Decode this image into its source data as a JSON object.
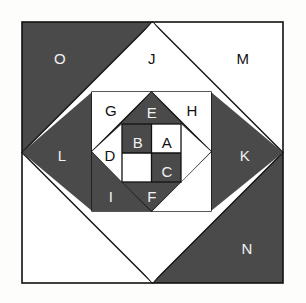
{
  "figure": {
    "canvas": {
      "width": 306,
      "height": 303
    },
    "colors": {
      "dark": "#4a4a4a",
      "light": "#ffffff",
      "stroke": "#111111",
      "background": "#fdfdfb",
      "label_on_dark": "#f2f2f2",
      "label_on_light": "#121212"
    },
    "regions": [
      {
        "id": "A",
        "label": "A",
        "fill": "light",
        "x": 167,
        "y": 142,
        "shape": "square-cell"
      },
      {
        "id": "B",
        "label": "B",
        "fill": "dark",
        "x": 138,
        "y": 142,
        "shape": "square-cell"
      },
      {
        "id": "C",
        "label": "C",
        "fill": "dark",
        "x": 167,
        "y": 171,
        "shape": "square-cell"
      },
      {
        "id": "D",
        "label": "D",
        "fill": "light",
        "x": 110,
        "y": 155,
        "shape": "triangle"
      },
      {
        "id": "E",
        "label": "E",
        "fill": "dark",
        "x": 152,
        "y": 112,
        "shape": "triangle"
      },
      {
        "id": "F",
        "label": "F",
        "fill": "dark",
        "x": 152,
        "y": 196,
        "shape": "triangle"
      },
      {
        "id": "G",
        "label": "G",
        "fill": "light",
        "x": 111,
        "y": 110,
        "shape": "corner-triangle"
      },
      {
        "id": "H",
        "label": "H",
        "fill": "light",
        "x": 192,
        "y": 110,
        "shape": "corner-triangle"
      },
      {
        "id": "I",
        "label": "I",
        "fill": "dark",
        "x": 111,
        "y": 196,
        "shape": "corner-triangle"
      },
      {
        "id": "J",
        "label": "J",
        "fill": "light",
        "x": 152,
        "y": 58,
        "shape": "triangle"
      },
      {
        "id": "K",
        "label": "K",
        "fill": "dark",
        "x": 245,
        "y": 155,
        "shape": "triangle"
      },
      {
        "id": "L",
        "label": "L",
        "fill": "dark",
        "x": 62,
        "y": 155,
        "shape": "triangle"
      },
      {
        "id": "M",
        "label": "M",
        "fill": "light",
        "x": 243,
        "y": 58,
        "shape": "corner-triangle"
      },
      {
        "id": "N",
        "label": "N",
        "fill": "dark",
        "x": 247,
        "y": 248,
        "shape": "corner-triangle"
      },
      {
        "id": "O",
        "label": "O",
        "fill": "dark",
        "x": 60,
        "y": 58,
        "shape": "corner-triangle"
      }
    ]
  }
}
